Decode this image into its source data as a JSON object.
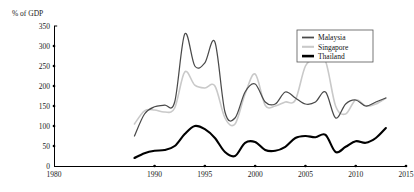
{
  "chart_data": {
    "type": "line",
    "title": "",
    "subtitle": "",
    "xlabel": "",
    "ylabel": "% of GDP",
    "ylim": [
      0,
      350
    ],
    "xlim": [
      1980,
      2015
    ],
    "ytick_labels": [
      "0",
      "50",
      "100",
      "150",
      "200",
      "250",
      "300",
      "350"
    ],
    "yticks": [
      0,
      50,
      100,
      150,
      200,
      250,
      300,
      350
    ],
    "xtick_labels": [
      "1980",
      "1990",
      "1995",
      "2000",
      "2005",
      "2010",
      "2015"
    ],
    "xticks": [
      1980,
      1990,
      1995,
      2000,
      2005,
      2010,
      2015
    ],
    "grid": false,
    "legend_position": "top-right",
    "x": [
      1988,
      1989,
      1990,
      1991,
      1992,
      1993,
      1994,
      1995,
      1996,
      1997,
      1998,
      1999,
      2000,
      2001,
      2002,
      2003,
      2004,
      2005,
      2006,
      2007,
      2008,
      2009,
      2010,
      2011,
      2012,
      2013
    ],
    "series": [
      {
        "name": "Malaysia",
        "color": "#4a4a4a",
        "width": 1.25,
        "values": [
          75,
          130,
          148,
          152,
          160,
          330,
          250,
          258,
          310,
          135,
          120,
          185,
          205,
          160,
          155,
          185,
          170,
          155,
          160,
          185,
          120,
          155,
          165,
          150,
          160,
          170
        ]
      },
      {
        "name": "Singapore",
        "color": "#c9c9c9",
        "width": 1.6,
        "values": [
          105,
          138,
          140,
          135,
          145,
          235,
          202,
          195,
          200,
          120,
          105,
          180,
          230,
          152,
          150,
          160,
          165,
          250,
          265,
          262,
          150,
          130,
          165,
          150,
          155,
          170
        ]
      },
      {
        "name": "Thailand",
        "color": "#000000",
        "width": 2.1,
        "values": [
          20,
          32,
          38,
          40,
          50,
          80,
          100,
          92,
          70,
          35,
          25,
          58,
          60,
          40,
          38,
          48,
          70,
          75,
          72,
          78,
          35,
          48,
          62,
          58,
          70,
          95
        ]
      }
    ]
  },
  "axis": {
    "y_axis_title": "% of GDP"
  },
  "legend": {
    "entries": [
      {
        "label": "Malaysia"
      },
      {
        "label": "Singapore"
      },
      {
        "label": "Thailand"
      }
    ]
  }
}
